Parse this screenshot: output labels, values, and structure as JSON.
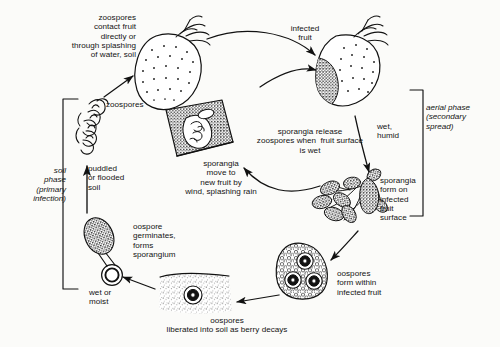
{
  "diagram": {
    "background_color": "#fbfbf9",
    "ink_color": "#111111",
    "type": "disease-cycle",
    "phases": [
      {
        "id": "soil",
        "label": "soil\nphase\n(primary\ninfection)",
        "side": "left",
        "style": "italic"
      },
      {
        "id": "aerial",
        "label": "aerial phase\n(secondary\nspread)",
        "side": "right",
        "style": "italic"
      }
    ],
    "labels": {
      "zoospores_contact": "zoospores\ncontact fruit\ndirectly or\nthrough splashing\nof water, soil",
      "zoospores": "zoospores",
      "puddled_soil": "puddled\nor flooded\nsoil",
      "infected_fruit": "infected\nfruit",
      "wet_humid": "wet,\nhumid",
      "sporangia_form": "sporangia\nform on\ninfected\nfruit\nsurface",
      "sporangia_release": "sporangia release\nzoospores when  fruit surface\nis wet",
      "sporangia_move": "sporangia\nmove to\nnew fruit by\nwind, splashing rain",
      "oospores_form": "oospores\nform within\ninfected fruit",
      "oospores_liberated": "oospores\nliberated into soil as berry decays",
      "oospore_germinates": "oospore\ngerminates,\nforms\nsporangium",
      "wet_or_moist": "wet or\nmoist"
    },
    "stages": [
      {
        "id": "healthy-fruit",
        "name": "healthy strawberry fruit"
      },
      {
        "id": "infected-fruit",
        "name": "infected strawberry fruit"
      },
      {
        "id": "sporangia-cluster",
        "name": "sporangia on infected fruit surface"
      },
      {
        "id": "oospore-fruit",
        "name": "fruit fragment containing oospores"
      },
      {
        "id": "soil-block",
        "name": "soil block with liberated oospore"
      },
      {
        "id": "germinating-oospore",
        "name": "germinating oospore forming sporangium"
      },
      {
        "id": "zoospore-cluster",
        "name": "released zoospores"
      },
      {
        "id": "sporangium-detail",
        "name": "sporangium releasing zoospores"
      }
    ]
  }
}
